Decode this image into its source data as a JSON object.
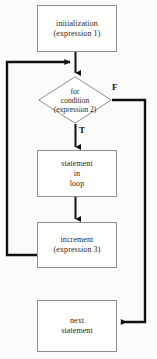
{
  "diagram": {
    "background_color": "#fbfbfa",
    "line_color": "#111111",
    "box_border_color": "#8e8e8e",
    "box_fill_color": "#fdfdfc",
    "nodes": {
      "initialization": {
        "label": "initialization\n(expression 1)",
        "shape": "rectangle"
      },
      "condition": {
        "label": "for\ncondition\n(expression 2)",
        "shape": "diamond"
      },
      "statement": {
        "label": "statement\nin\nloop",
        "shape": "rectangle"
      },
      "increment": {
        "label": "increment\n(expression 3)",
        "shape": "rectangle"
      },
      "next": {
        "label": "next\nstatement",
        "shape": "rectangle"
      }
    },
    "branches": {
      "true_label": "T",
      "false_label": "F"
    }
  }
}
